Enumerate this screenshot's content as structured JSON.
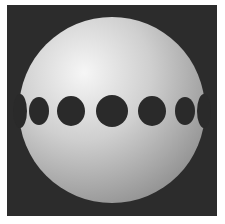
{
  "scene": {
    "description": "Shaded white sphere with a band of dark circular holes around its equator on a dark square background",
    "background_color": "#2c2c2c",
    "page_color": "#ffffff",
    "sphere": {
      "cx": 112,
      "cy": 110,
      "r": 93,
      "highlight": "#f4f4f4",
      "mid": "#c4c4c4",
      "shadow": "#8a8a8a"
    },
    "holes": [
      {
        "cx": 20,
        "cy": 111,
        "rx": 7,
        "ry": 17
      },
      {
        "cx": 39,
        "cy": 111,
        "rx": 10,
        "ry": 14
      },
      {
        "cx": 71,
        "cy": 111,
        "rx": 14,
        "ry": 15
      },
      {
        "cx": 112,
        "cy": 111,
        "rx": 16,
        "ry": 16
      },
      {
        "cx": 152,
        "cy": 111,
        "rx": 14,
        "ry": 15
      },
      {
        "cx": 185,
        "cy": 111,
        "rx": 10,
        "ry": 14
      },
      {
        "cx": 204,
        "cy": 111,
        "rx": 7,
        "ry": 17
      }
    ],
    "hole_color": "#2a2a2a"
  }
}
